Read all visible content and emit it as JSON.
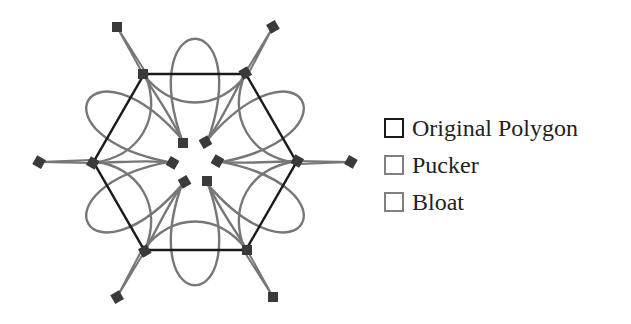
{
  "diagram": {
    "center": [
      195,
      162
    ],
    "colors": {
      "original": "#1a1a1a",
      "curve": "#777777",
      "handle": "#3a3a3a"
    },
    "rotations": [
      0,
      60,
      120,
      180,
      240,
      300
    ]
  },
  "legend": {
    "items": [
      {
        "label": "Original Polygon",
        "color": "#1a1a1a"
      },
      {
        "label": "Pucker",
        "color": "#777777"
      },
      {
        "label": "Bloat",
        "color": "#777777"
      }
    ]
  }
}
